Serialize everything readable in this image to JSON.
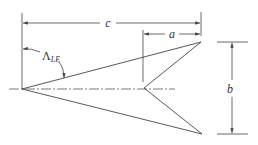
{
  "diagram": {
    "title": "",
    "type": "swept wing planform dimension diagram",
    "colors": {
      "line": "#444444",
      "background": "#ffffff"
    },
    "labels": {
      "c": "c",
      "a": "a",
      "b": "b",
      "sweep_symbol": "Λ",
      "sweep_subscript": "LE"
    },
    "elements": [
      {
        "id": "dim-c",
        "label": "c",
        "kind": "dimension",
        "description": "overall length from apex to tip"
      },
      {
        "id": "dim-a",
        "label": "a",
        "kind": "dimension",
        "description": "length from notch to tip"
      },
      {
        "id": "dim-b",
        "label": "b",
        "kind": "dimension",
        "description": "span between tips"
      },
      {
        "id": "angle-sweep",
        "label": "ΛLE",
        "kind": "angle",
        "description": "leading edge sweep angle"
      },
      {
        "id": "centerline",
        "kind": "dash-dot line",
        "description": "axis of symmetry"
      }
    ]
  }
}
